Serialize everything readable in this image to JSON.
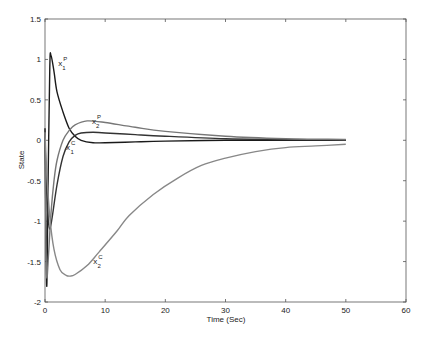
{
  "chart_data": {
    "type": "line",
    "title": "",
    "xlabel": "Time (Sec)",
    "ylabel": "State",
    "xlim": [
      0,
      60
    ],
    "ylim": [
      -2,
      1.5
    ],
    "xticks": [
      0,
      10,
      20,
      30,
      40,
      50,
      60
    ],
    "yticks": [
      -2,
      -1.5,
      -1,
      -0.5,
      0,
      0.5,
      1,
      1.5
    ],
    "xtick_labels": [
      "0",
      "10",
      "20",
      "30",
      "40",
      "50",
      "60"
    ],
    "ytick_labels": [
      "-2",
      "-1.5",
      "-1",
      "-0.5",
      "0",
      "0.5",
      "1",
      "1.5"
    ],
    "grid": false,
    "legend": "none (curves annotated inline)",
    "series": [
      {
        "name": "x1P",
        "label_base": "x",
        "label_sub": "1",
        "label_sup": "P",
        "color": "#1a1a1a",
        "x": [
          0,
          0.15,
          0.3,
          0.5,
          0.8,
          1.0,
          1.5,
          2.0,
          3.0,
          4.0,
          5.0,
          6.0,
          8.0,
          10,
          15,
          20,
          30,
          40,
          50
        ],
        "y": [
          0.15,
          -1.0,
          -1.8,
          -0.6,
          0.9,
          1.05,
          0.85,
          0.6,
          0.35,
          0.15,
          0.05,
          0.0,
          -0.03,
          -0.03,
          -0.02,
          -0.01,
          0.0,
          0.0,
          0.0
        ]
      },
      {
        "name": "x1C",
        "label_base": "x",
        "label_sub": "1",
        "label_sup": "C",
        "color": "#333333",
        "x": [
          0,
          0.2,
          0.5,
          0.8,
          1.2,
          2.0,
          3.0,
          4.0,
          5.0,
          6.0,
          8.0,
          10,
          15,
          20,
          30,
          40,
          50
        ],
        "y": [
          0.0,
          -0.5,
          -0.95,
          -1.1,
          -0.95,
          -0.55,
          -0.2,
          -0.02,
          0.06,
          0.09,
          0.1,
          0.09,
          0.07,
          0.05,
          0.02,
          0.01,
          0.0
        ]
      },
      {
        "name": "x2P",
        "label_base": "x",
        "label_sub": "2",
        "label_sup": "P",
        "color": "#777777",
        "x": [
          0,
          0.15,
          0.3,
          0.6,
          1.0,
          1.5,
          2.0,
          3.0,
          4.0,
          5.0,
          7.0,
          10,
          15,
          20,
          30,
          40,
          50
        ],
        "y": [
          0.0,
          -1.2,
          -1.7,
          -1.4,
          -0.9,
          -0.5,
          -0.25,
          0.0,
          0.12,
          0.19,
          0.24,
          0.22,
          0.16,
          0.11,
          0.05,
          0.02,
          0.01
        ]
      },
      {
        "name": "x2C",
        "label_base": "x",
        "label_sub": "2",
        "label_sup": "C",
        "color": "#888888",
        "x": [
          0,
          0.3,
          0.8,
          1.5,
          2.5,
          3.5,
          4.2,
          5.0,
          7.0,
          9.0,
          12,
          14,
          18,
          22,
          26,
          30,
          35,
          40,
          45,
          50
        ],
        "y": [
          0.1,
          -0.4,
          -0.95,
          -1.35,
          -1.6,
          -1.67,
          -1.68,
          -1.66,
          -1.55,
          -1.38,
          -1.12,
          -0.93,
          -0.67,
          -0.47,
          -0.31,
          -0.22,
          -0.14,
          -0.09,
          -0.07,
          -0.05
        ]
      }
    ],
    "annotations": [
      {
        "text": "x1P",
        "x": 2.2,
        "y": 0.92
      },
      {
        "text": "x2P",
        "x": 7.8,
        "y": 0.2
      },
      {
        "text": "x1C",
        "x": 3.5,
        "y": -0.12
      },
      {
        "text": "x2C",
        "x": 8.0,
        "y": -1.53
      }
    ]
  },
  "axes": {
    "xlabel": "Time (Sec)",
    "ylabel": "State"
  }
}
